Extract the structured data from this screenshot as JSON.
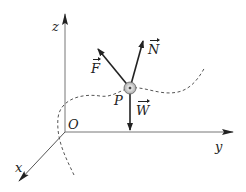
{
  "diagram": {
    "type": "3D coordinate system with force vectors on a particle on a curve",
    "axes": {
      "z": {
        "label": "z"
      },
      "y": {
        "label": "y"
      },
      "x": {
        "label": "x"
      },
      "origin": {
        "label": "O"
      }
    },
    "point": {
      "label": "P"
    },
    "vectors": [
      {
        "name": "F",
        "label": "F",
        "direction": "up-left"
      },
      {
        "name": "N",
        "label": "N",
        "direction": "up-right"
      },
      {
        "name": "W",
        "label": "W",
        "direction": "down"
      }
    ],
    "curve": {
      "style": "dashed",
      "description": "space curve passing through P"
    },
    "colors": {
      "line": "#222222",
      "axis": "#555555",
      "curve": "#555555",
      "bead": "#999999"
    }
  }
}
